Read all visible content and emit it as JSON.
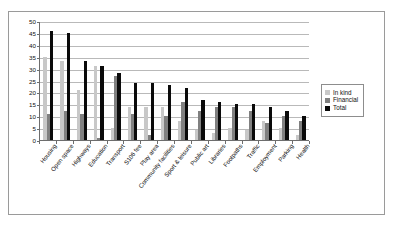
{
  "chart_data": {
    "type": "bar",
    "title": "",
    "xlabel": "",
    "ylabel": "",
    "ylim": [
      0,
      50
    ],
    "ytick_step": 5,
    "yticks": [
      50,
      45,
      40,
      35,
      30,
      25,
      20,
      15,
      10,
      5,
      0
    ],
    "grid": true,
    "legend_position": "right",
    "categories": [
      "Housing",
      "Open space",
      "Highways",
      "Education",
      "Transport",
      "S106 fee",
      "Play area",
      "Community facilities",
      "Sport & leisure",
      "Public art",
      "Libraries",
      "Footpaths",
      "Traffic",
      "Employment",
      "Parking",
      "Health"
    ],
    "series": [
      {
        "name": "In kind",
        "color": "#c8c8c8",
        "values": [
          35,
          33,
          21,
          31,
          5,
          14,
          14,
          14,
          8,
          4,
          3,
          5,
          4,
          8,
          5,
          2
        ]
      },
      {
        "name": "Financial",
        "color": "#808080",
        "values": [
          11,
          12,
          11,
          1,
          27,
          11,
          2,
          10,
          16,
          12,
          14,
          14,
          12,
          7,
          10,
          8
        ]
      },
      {
        "name": "Total",
        "color": "#0a0a0a",
        "values": [
          46,
          45,
          33,
          31,
          28,
          24,
          24,
          23,
          22,
          17,
          16,
          15,
          15,
          14,
          12,
          10
        ]
      }
    ]
  },
  "legend": {
    "items": [
      {
        "label": "In kind"
      },
      {
        "label": "Financial"
      },
      {
        "label": "Total"
      }
    ]
  }
}
